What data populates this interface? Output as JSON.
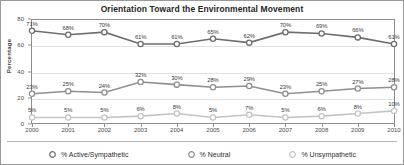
{
  "chart_data": {
    "type": "line",
    "title": "Orientation Toward the Environmental Movement",
    "xlabel": "",
    "ylabel": "Percentage",
    "categories": [
      "2000",
      "2001",
      "2002",
      "2003",
      "2004",
      "2005",
      "2006",
      "2007",
      "2008",
      "2009",
      "2010"
    ],
    "ylim": [
      0,
      80
    ],
    "yticks": [
      0,
      20,
      40,
      60,
      80
    ],
    "grid": true,
    "legend_position": "bottom",
    "value_suffix": "%",
    "series": [
      {
        "name": "% Active/Sympathetic",
        "color": "#6e6e6e",
        "marker": "circle-open",
        "values": [
          71,
          68,
          70,
          61,
          61,
          65,
          62,
          70,
          69,
          66,
          61
        ],
        "labels": [
          "71%",
          "68%",
          "70%",
          "61%",
          "61%",
          "65%",
          "62%",
          "70%",
          "69%",
          "66%",
          "61%"
        ]
      },
      {
        "name": "% Neutral",
        "color": "#8f8f8f",
        "marker": "circle-open",
        "values": [
          23,
          25,
          24,
          32,
          30,
          28,
          29,
          23,
          25,
          27,
          28
        ],
        "labels": [
          "23%",
          "25%",
          "24%",
          "32%",
          "30%",
          "28%",
          "29%",
          "23%",
          "25%",
          "27%",
          "28%"
        ]
      },
      {
        "name": "% Unsympathetic",
        "color": "#c4c4c4",
        "marker": "circle-open",
        "values": [
          5,
          5,
          5,
          6,
          8,
          5,
          7,
          5,
          6,
          8,
          10
        ],
        "labels": [
          "5%",
          "5%",
          "5%",
          "6%",
          "8%",
          "5%",
          "7%",
          "5%",
          "6%",
          "8%",
          "10%"
        ]
      }
    ]
  }
}
